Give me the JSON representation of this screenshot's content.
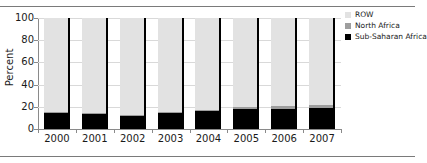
{
  "chart_data": {
    "type": "bar",
    "subtype": "stacked-bar-100",
    "title": "",
    "xlabel": "",
    "ylabel": "Percent",
    "ylim": [
      0,
      100
    ],
    "yticks": [
      0,
      20,
      40,
      60,
      80,
      100
    ],
    "ytick_labels": [
      "0",
      "20",
      "40",
      "60",
      "80",
      "100"
    ],
    "grid": true,
    "legend_position": "top-right",
    "categories": [
      "2000",
      "2001",
      "2002",
      "2003",
      "2004",
      "2005",
      "2006",
      "2007"
    ],
    "series": [
      {
        "name": "Sub-Saharan Africa",
        "color": "#000000",
        "values": [
          15,
          14,
          12,
          15,
          16,
          18,
          18,
          19
        ]
      },
      {
        "name": "North Africa",
        "color": "#9e9e9e",
        "values": [
          0.5,
          0.5,
          0.5,
          0.5,
          1.5,
          2,
          2.5,
          3
        ]
      },
      {
        "name": "ROW",
        "color": "#e2e2e2",
        "values": [
          84.5,
          85.5,
          87.5,
          84.5,
          82.5,
          80,
          79.5,
          78
        ]
      }
    ]
  },
  "legend": {
    "entries": [
      {
        "label": "ROW",
        "color": "#e2e2e2"
      },
      {
        "label": "North Africa",
        "color": "#9e9e9e"
      },
      {
        "label": "Sub-Saharan Africa",
        "color": "#000000"
      }
    ]
  },
  "axes": {
    "y_title": "Percent"
  }
}
